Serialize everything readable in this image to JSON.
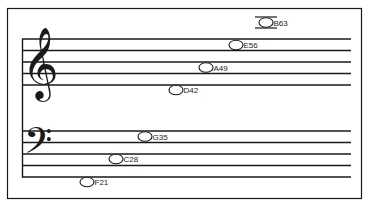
{
  "diagram": {
    "type": "grand-staff-note-chart",
    "colors": {
      "ink": "#1a1a1a",
      "background": "#ffffff"
    },
    "staves": [
      {
        "name": "treble",
        "clef": "treble-clef",
        "clef_glyph": "𝄞"
      },
      {
        "name": "bass",
        "clef": "bass-clef",
        "clef_glyph": "𝄢"
      }
    ],
    "notes": [
      {
        "label": "B63",
        "staff": "treble",
        "ledger_line": true
      },
      {
        "label": "E56",
        "staff": "treble",
        "ledger_line": false
      },
      {
        "label": "A49",
        "staff": "treble",
        "ledger_line": false
      },
      {
        "label": "D42",
        "staff": "treble",
        "ledger_line": false
      },
      {
        "label": "G35",
        "staff": "bass",
        "ledger_line": false
      },
      {
        "label": "C28",
        "staff": "bass",
        "ledger_line": false
      },
      {
        "label": "F21",
        "staff": "bass",
        "ledger_line": false
      }
    ]
  }
}
